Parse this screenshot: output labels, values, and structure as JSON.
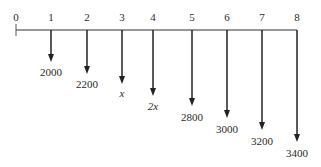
{
  "diagram": {
    "type": "cash-flow-diagram",
    "axis": {
      "periods": [
        "0",
        "1",
        "2",
        "3",
        "4",
        "5",
        "6",
        "7",
        "8"
      ]
    },
    "flows": [
      {
        "period": "1",
        "label": "2000",
        "direction": "down"
      },
      {
        "period": "2",
        "label": "2200",
        "direction": "down"
      },
      {
        "period": "3",
        "label": "x",
        "direction": "down"
      },
      {
        "period": "4",
        "label": "2x",
        "direction": "down"
      },
      {
        "period": "5",
        "label": "2800",
        "direction": "down"
      },
      {
        "period": "6",
        "label": "3000",
        "direction": "down"
      },
      {
        "period": "7",
        "label": "3200",
        "direction": "down"
      },
      {
        "period": "8",
        "label": "3400",
        "direction": "down"
      }
    ],
    "colors": {
      "line": "#222222",
      "background": "#ffffff"
    }
  }
}
